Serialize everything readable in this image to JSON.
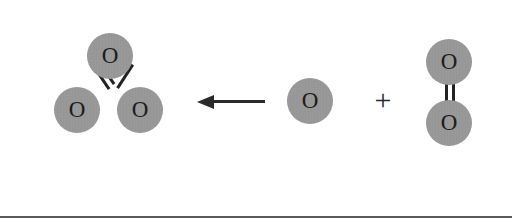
{
  "diagram": {
    "type": "chemical-reaction",
    "direction": "right-to-left",
    "equation": "O + O2 -> O3",
    "colors": {
      "atom_fill": "#9a9a9a",
      "atom_label": "#1d1d1d",
      "bond": "#222222",
      "arrow": "#2a2a2a",
      "background": "#ffffff",
      "rule": "#5b5b5b"
    },
    "product": {
      "name": "ozone-molecule",
      "formula": "O3",
      "atoms": [
        {
          "name": "ozone-central-oxygen",
          "label": "O",
          "cx": 110,
          "cy": 56,
          "r": 23
        },
        {
          "name": "ozone-left-oxygen",
          "label": "O",
          "cx": 77,
          "cy": 110,
          "r": 23
        },
        {
          "name": "ozone-right-oxygen",
          "label": "O",
          "cx": 140,
          "cy": 110,
          "r": 23
        }
      ],
      "bonds": [
        {
          "name": "ozone-double-bond",
          "order": 2,
          "from": "ozone-central-oxygen",
          "to": "ozone-left-oxygen"
        },
        {
          "name": "ozone-single-bond",
          "order": 1,
          "from": "ozone-central-oxygen",
          "to": "ozone-right-oxygen"
        }
      ]
    },
    "arrow": {
      "name": "reaction-arrow",
      "label": "",
      "points": "left",
      "x_start": 265,
      "x_end": 199,
      "y": 102
    },
    "reactant_atom": {
      "name": "free-oxygen-atom",
      "formula": "O",
      "atoms": [
        {
          "name": "free-oxygen",
          "label": "O",
          "cx": 310,
          "cy": 101,
          "r": 23
        }
      ]
    },
    "operator": {
      "name": "plus-operator",
      "label": "+",
      "x": 382,
      "y": 101
    },
    "reactant_molecule": {
      "name": "dioxygen-molecule",
      "formula": "O2",
      "atoms": [
        {
          "name": "dioxygen-top-oxygen",
          "label": "O",
          "cx": 449,
          "cy": 62,
          "r": 23
        },
        {
          "name": "dioxygen-bottom-oxygen",
          "label": "O",
          "cx": 449,
          "cy": 123,
          "r": 23
        }
      ],
      "bonds": [
        {
          "name": "dioxygen-double-bond",
          "order": 2,
          "from": "dioxygen-top-oxygen",
          "to": "dioxygen-bottom-oxygen"
        }
      ]
    },
    "footer_rule": {
      "name": "page-divider",
      "y": 216,
      "height": 2
    }
  }
}
